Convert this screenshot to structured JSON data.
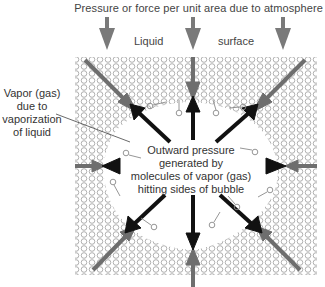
{
  "diagram": {
    "title": "Pressure or force per unit area due to atmosphere",
    "labels": {
      "liquid": "Liquid",
      "surface": "surface"
    },
    "vapor_label": {
      "line1": "Vapor (gas)",
      "line2": "due to",
      "line3": "vaporization",
      "line4": "of liquid"
    },
    "center_label": {
      "line1": "Outward pressure",
      "line2": "generated by",
      "line3": "molecules of vapor (gas)",
      "line4": "hitting sides of bubble"
    },
    "colors": {
      "inward_arrow": "#6e6e6e",
      "outward_arrow": "#111111",
      "liquid_molecule": "#9a9a9a",
      "vapor_molecule": "#8a8a8a",
      "text": "#333333"
    }
  }
}
